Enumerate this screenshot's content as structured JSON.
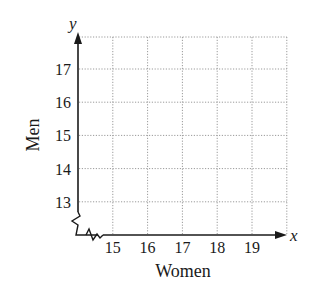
{
  "chart_data": {
    "type": "scatter",
    "title": "",
    "xlabel": "Women",
    "ylabel": "Men",
    "x_axis_symbol": "x",
    "y_axis_symbol": "y",
    "x_ticks": [
      "15",
      "16",
      "17",
      "18",
      "19"
    ],
    "y_ticks": [
      "13",
      "14",
      "15",
      "16",
      "17"
    ],
    "xlim": [
      14,
      20
    ],
    "ylim": [
      12,
      18
    ],
    "grid": true,
    "grid_style": "dotted",
    "axis_breaks": [
      "x",
      "y"
    ],
    "series": [],
    "legend": null
  },
  "colors": {
    "axis": "#1a1a1a",
    "grid": "#9a9a9a",
    "background": "#ffffff"
  }
}
